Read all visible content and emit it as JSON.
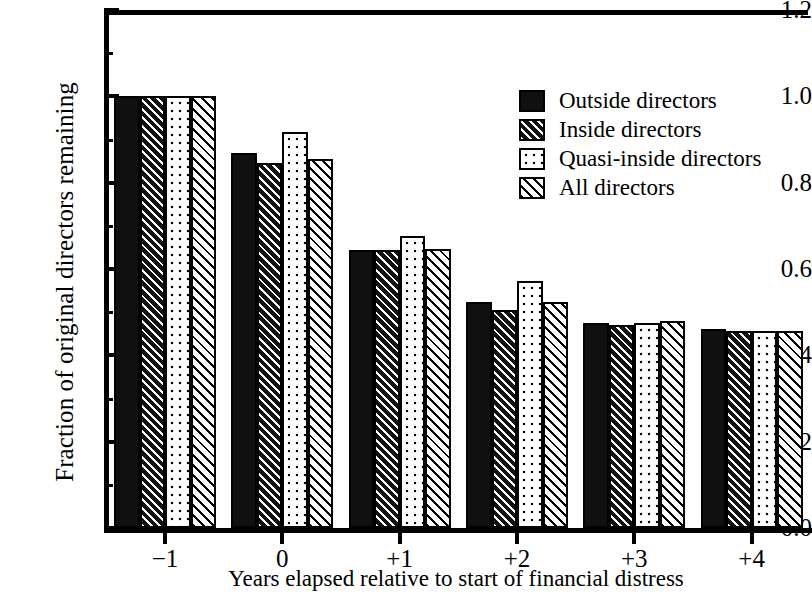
{
  "chart_data": {
    "type": "bar",
    "title": "",
    "xlabel": "Years elapsed relative to start of financial distress",
    "ylabel": "Fraction of original directors remaining",
    "categories": [
      "−1",
      "0",
      "+1",
      "+2",
      "+3",
      "+4"
    ],
    "ylim": [
      0.0,
      1.2
    ],
    "ytick_labels": [
      "0.0",
      "0.2",
      "0.4",
      "0.6",
      "0.8",
      "1.0",
      "1.2"
    ],
    "ytick_values": [
      0.0,
      0.2,
      0.4,
      0.6,
      0.8,
      1.0,
      1.2
    ],
    "yminor_values": [
      0.1,
      0.3,
      0.5,
      0.7,
      0.9,
      1.1
    ],
    "grid": false,
    "legend_position": "upper right",
    "series": [
      {
        "name": "Outside directors",
        "fill": "solid-black",
        "values": [
          1.0,
          0.868,
          0.643,
          0.523,
          0.474,
          0.46
        ]
      },
      {
        "name": "Inside directors",
        "fill": "black-with-white-hatch",
        "values": [
          1.0,
          0.846,
          0.643,
          0.505,
          0.47,
          0.457
        ]
      },
      {
        "name": "Quasi-inside directors",
        "fill": "white-with-black-dots",
        "values": [
          1.0,
          0.918,
          0.676,
          0.573,
          0.476,
          0.456
        ]
      },
      {
        "name": "All directors",
        "fill": "white-with-black-hatch",
        "values": [
          1.0,
          0.854,
          0.647,
          0.523,
          0.48,
          0.457
        ]
      }
    ]
  },
  "colors": {
    "axis": "#000000",
    "background": "#ffffff",
    "ink": "#000000"
  }
}
